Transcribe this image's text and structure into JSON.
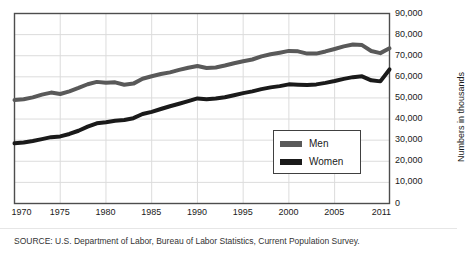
{
  "figure": {
    "clipped_header_text": "",
    "source_note": "SOURCE: U.S. Department of Labor, Bureau of Labor Statistics, Current Population Survey."
  },
  "legend": {
    "position": "inside-center-right",
    "entries": [
      {
        "label": "Men",
        "color": "#595959"
      },
      {
        "label": "Women",
        "color": "#1a1a1a"
      }
    ]
  },
  "chart_data": {
    "type": "line",
    "title": "",
    "subtitle": "",
    "xlabel": "",
    "ylabel": "Numbers in thousands",
    "xlim": [
      1970,
      2011
    ],
    "ylim": [
      0,
      90000
    ],
    "grid": true,
    "xticks": [
      1970,
      1975,
      1980,
      1985,
      1990,
      1995,
      2000,
      2005,
      2011
    ],
    "xtick_labels": [
      "1970",
      "1975",
      "1980",
      "1985",
      "1990",
      "1995",
      "2000",
      "2005",
      "2011"
    ],
    "yticks": [
      0,
      10000,
      20000,
      30000,
      40000,
      50000,
      60000,
      70000,
      80000,
      90000
    ],
    "ytick_labels": [
      "0",
      "10,000",
      "20,000",
      "30,000",
      "40,000",
      "50,000",
      "60,000",
      "70,000",
      "80,000",
      "90,000"
    ],
    "x": [
      1970,
      1971,
      1972,
      1973,
      1974,
      1975,
      1976,
      1977,
      1978,
      1979,
      1980,
      1981,
      1982,
      1983,
      1984,
      1985,
      1986,
      1987,
      1988,
      1989,
      1990,
      1991,
      1992,
      1993,
      1994,
      1995,
      1996,
      1997,
      1998,
      1999,
      2000,
      2001,
      2002,
      2003,
      2004,
      2005,
      2006,
      2007,
      2008,
      2009,
      2010,
      2011
    ],
    "series": [
      {
        "name": "Men",
        "color": "#595959",
        "values": [
          48990,
          49390,
          50260,
          51560,
          52540,
          51860,
          53140,
          54730,
          56480,
          57610,
          57190,
          57400,
          56270,
          56790,
          59090,
          60280,
          61320,
          62110,
          63270,
          64320,
          65100,
          64220,
          64440,
          65350,
          66450,
          67380,
          68210,
          69690,
          70690,
          71450,
          72290,
          72080,
          71000,
          71010,
          72030,
          73180,
          74430,
          75340,
          75030,
          72240,
          71230,
          73500
        ]
      },
      {
        "name": "Women",
        "color": "#1a1a1a",
        "values": [
          28560,
          28920,
          29630,
          30500,
          31430,
          31780,
          32940,
          34460,
          36380,
          38010,
          38490,
          39180,
          39560,
          40420,
          42390,
          43420,
          44760,
          46080,
          47230,
          48480,
          49780,
          49430,
          49750,
          50300,
          51310,
          52280,
          53110,
          54180,
          55000,
          55600,
          56430,
          56290,
          56110,
          56420,
          57150,
          58000,
          59040,
          59850,
          60230,
          58350,
          57850,
          63500
        ]
      }
    ]
  }
}
